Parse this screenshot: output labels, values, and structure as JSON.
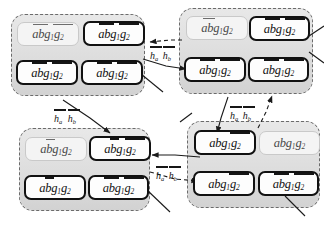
{
  "diagram": {
    "title_visible": false,
    "cell_text": {
      "prefix": "ab",
      "g1": "g",
      "g1_sub": "1",
      "g2": "g",
      "g2_sub": "2",
      "full": "abg1g2"
    },
    "edge_label": {
      "h_a": "h",
      "h_a_sub": "a",
      "h_b": "h",
      "h_b_sub": "b",
      "full": "ha hb"
    },
    "colors": {
      "group_fill": "#dcdcdc",
      "group_border": "#6b6b6b",
      "cell_border_strong": "#111111",
      "cell_border_faint": "#c9c9c9",
      "cell_fill": "#fdfdfd",
      "cell_fill_faint": "#f4f4f4",
      "text": "#121212",
      "edge": "#1a1a1a",
      "page_background": "#ffffff"
    },
    "groups": [
      {
        "id": "group-top-left",
        "name": "top-left-group",
        "cells": [
          {
            "id": "tl-1",
            "style": "faint",
            "bars": "ab+g1g2"
          },
          {
            "id": "tl-2",
            "style": "strong",
            "bars": "ab+g1g2"
          },
          {
            "id": "tl-3",
            "style": "strong",
            "bars": "ab+g1g2"
          },
          {
            "id": "tl-4",
            "style": "strong",
            "bars": "ab+g1g2"
          }
        ]
      },
      {
        "id": "group-top-right",
        "name": "top-right-group",
        "cells": [
          {
            "id": "tr-1",
            "style": "faint",
            "bars": "ab"
          },
          {
            "id": "tr-2",
            "style": "strong",
            "bars": "ab+g1g2"
          },
          {
            "id": "tr-3",
            "style": "strong",
            "bars": "ab+g1g2"
          },
          {
            "id": "tr-4",
            "style": "strong",
            "bars": "ab+g1g2"
          }
        ]
      },
      {
        "id": "group-bottom-left",
        "name": "bottom-left-group",
        "cells": [
          {
            "id": "bl-1",
            "style": "faint",
            "bars": "b"
          },
          {
            "id": "bl-2",
            "style": "strong",
            "bars": "b+g1g2"
          },
          {
            "id": "bl-3",
            "style": "strong",
            "bars": "b"
          },
          {
            "id": "bl-4",
            "style": "strong",
            "bars": "ab+g1g2"
          }
        ]
      },
      {
        "id": "group-bottom-right",
        "name": "bottom-right-group",
        "cells": [
          {
            "id": "br-1",
            "style": "strong",
            "bars": "g1g2"
          },
          {
            "id": "br-2",
            "style": "faint",
            "bars": "none"
          },
          {
            "id": "br-3",
            "style": "strong",
            "bars": "g1g2"
          },
          {
            "id": "br-4",
            "style": "strong",
            "bars": "ab+g1g2"
          }
        ]
      }
    ],
    "edge_labels": [
      {
        "id": "lbl-1",
        "name": "edge-label-top"
      },
      {
        "id": "lbl-2",
        "name": "edge-label-left"
      },
      {
        "id": "lbl-3",
        "name": "edge-label-middle"
      },
      {
        "id": "lbl-4",
        "name": "edge-label-bottom"
      }
    ]
  }
}
